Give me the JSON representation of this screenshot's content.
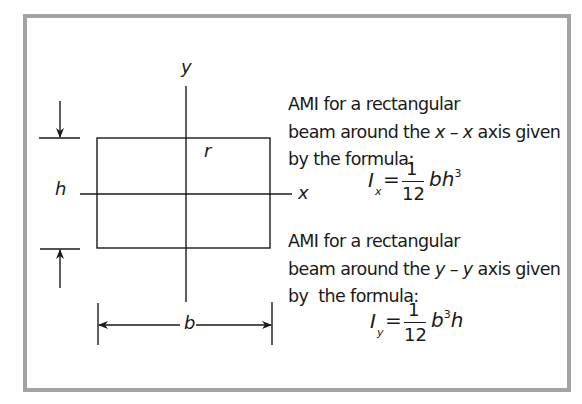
{
  "diagram": {
    "labels": {
      "y_axis": "y",
      "x_axis": "x",
      "radius": "r",
      "height": "h",
      "width": "b"
    },
    "colors": {
      "frame_border": "#a3a3a3",
      "lines": "#1a1a1a",
      "background": "#ffffff"
    },
    "descriptions": [
      {
        "line1": "AMI for a rectangular",
        "line2_pre": "beam around the ",
        "axis_expr": "x – x",
        "line2_post": " axis given",
        "line3": "by the formula:",
        "formula": {
          "symbol": "I",
          "subscript": "x",
          "equals": "=",
          "numerator": "1",
          "denominator": "12",
          "term_base1": "bh",
          "term_exp1": "3",
          "term_base2": "",
          "display": "I_x = 1/12 bh³"
        }
      },
      {
        "line1": "AMI for a rectangular",
        "line2_pre": "beam around the ",
        "axis_expr": "y – y",
        "line2_post": " axis given",
        "line3": "by  the formula:",
        "formula": {
          "symbol": "I",
          "subscript": "y",
          "equals": "=",
          "numerator": "1",
          "denominator": "12",
          "term_base1": "b",
          "term_exp1": "3",
          "term_base2": "h",
          "display": "I_y = 1/12 b³h"
        }
      }
    ]
  }
}
